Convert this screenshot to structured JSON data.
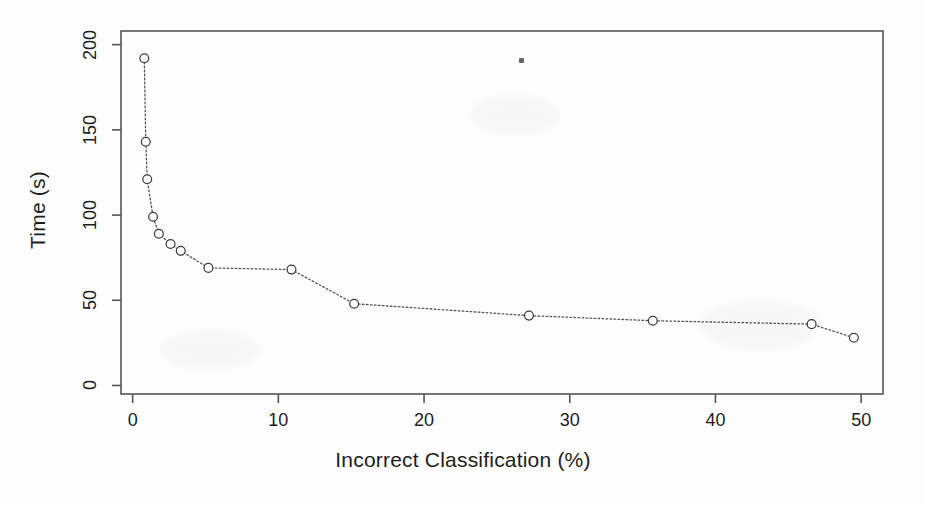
{
  "chart_data": {
    "type": "line",
    "title": "",
    "xlabel": "Incorrect Classification (%)",
    "ylabel": "Time (s)",
    "xlim": [
      -0.8,
      51.5
    ],
    "ylim": [
      -5,
      208
    ],
    "xticks": [
      0,
      10,
      20,
      30,
      40,
      50
    ],
    "yticks": [
      0,
      50,
      100,
      150,
      200
    ],
    "xtick_labels": [
      "0",
      "10",
      "20",
      "30",
      "40",
      "50"
    ],
    "ytick_labels": [
      "0",
      "50",
      "100",
      "150",
      "200"
    ],
    "grid": false,
    "legend": "none",
    "marker": "open-circle",
    "linestyle": "dotted",
    "series": [
      {
        "name": "Time vs Incorrect Classification",
        "x": [
          0.8,
          0.9,
          1.0,
          1.4,
          1.8,
          2.6,
          3.3,
          5.2,
          10.9,
          15.2,
          27.2,
          35.7,
          46.6,
          49.5
        ],
        "y": [
          192,
          143,
          121,
          99,
          89,
          83,
          79,
          69,
          68,
          48,
          41,
          38,
          36,
          28
        ]
      }
    ]
  },
  "figure": {
    "frame_color": "#555555",
    "marker_color": "#3c3c3c",
    "line_color": "#555555",
    "text_color": "#1d1d1d",
    "background": "#fdfdfd"
  },
  "artifact": {
    "name": "scan-speck"
  }
}
